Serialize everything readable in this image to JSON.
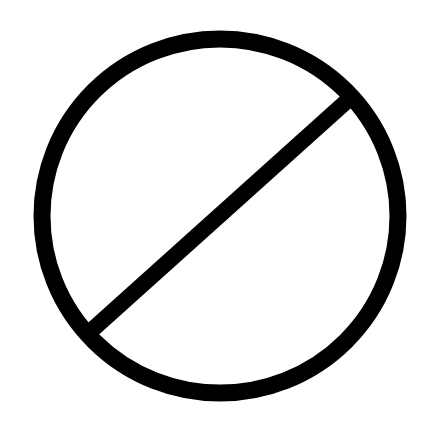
{
  "symbol": {
    "name": "prohibition-sign",
    "icon": "no-symbol-icon",
    "stroke_color": "#000000",
    "background_color": "#ffffff",
    "circle": {
      "cx": 220,
      "cy": 216,
      "r": 178,
      "stroke_width": 17
    },
    "slash": {
      "x1": 94,
      "y1": 328,
      "x2": 346,
      "y2": 102,
      "stroke_width": 16
    }
  }
}
